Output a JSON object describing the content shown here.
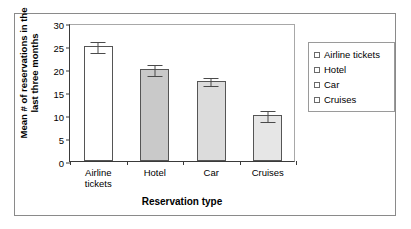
{
  "chart_data": {
    "type": "bar",
    "title": "",
    "xlabel": "Reservation type",
    "ylabel_lines": [
      "Mean # of reservations in the",
      "last three months"
    ],
    "ylabel": "Mean # of reservations in the last three months",
    "categories": [
      "Airline tickets",
      "Hotel",
      "Car",
      "Cruises"
    ],
    "category_label_lines": [
      [
        "Airline",
        "tickets"
      ],
      [
        "Hotel"
      ],
      [
        "Car"
      ],
      [
        "Cruises"
      ]
    ],
    "values": [
      25,
      20,
      17.5,
      10
    ],
    "errors": [
      1.2,
      1.3,
      1.0,
      1.2
    ],
    "ylim": [
      0,
      30
    ],
    "yticks": [
      0,
      5,
      10,
      15,
      20,
      25,
      30
    ],
    "ytick_labels": [
      "0",
      "5",
      "10",
      "15",
      "20",
      "25",
      "30"
    ],
    "grid": false,
    "legend_position": "right",
    "legend_entries": [
      "Airline tickets",
      "Hotel",
      "Car",
      "Cruises"
    ],
    "bar_colors": [
      "#ffffff",
      "#c9c9c9",
      "#dcdcdc",
      "#e6e6e6"
    ],
    "bar_edge_color": "#555555",
    "error_bar_color": "#4a4a4a",
    "axis_color": "#3a3a3a",
    "frame_color": "#8a8a8a",
    "background_color": "#ffffff",
    "legend_swatch_colors": [
      "#ffffff",
      "#ffffff",
      "#ffffff",
      "#ffffff"
    ]
  }
}
